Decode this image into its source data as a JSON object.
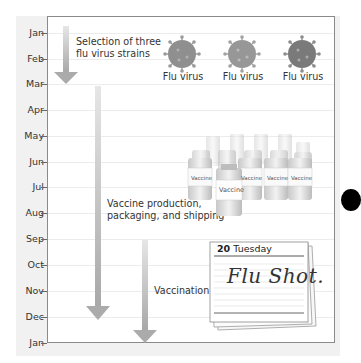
{
  "timeline": {
    "months": [
      "Jan",
      "Feb",
      "Mar",
      "Apr",
      "May",
      "Jun",
      "Jul",
      "Aug",
      "Sep",
      "Oct",
      "Nov",
      "Dec",
      "Jan"
    ]
  },
  "stages": [
    {
      "label_line1": "Selection of three",
      "label_line2": "flu virus strains",
      "start": "Jan",
      "end": "Mar"
    },
    {
      "label_line1": "Vaccine production,",
      "label_line2": "packaging, and shipping",
      "start": "Mar",
      "end": "Dec"
    },
    {
      "label_line1": "Vaccination",
      "label_line2": "",
      "start": "Sep",
      "end": "Jan"
    }
  ],
  "viruses": [
    {
      "label": "Flu virus"
    },
    {
      "label": "Flu virus"
    },
    {
      "label": "Flu virus"
    }
  ],
  "vaccine": {
    "bottle_label": "Vaccine"
  },
  "calendar": {
    "day": "20",
    "weekday": "Tuesday",
    "note": "Flu Shot."
  },
  "colors": {
    "arrow": "#b4b4b4",
    "frame": "#f1f1f1",
    "axis": "#8a8a8a",
    "virus": "#8c8c8c"
  }
}
